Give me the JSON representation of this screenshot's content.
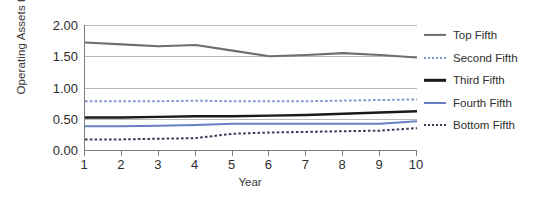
{
  "chart_data": {
    "type": "line",
    "title": "",
    "xlabel": "Year",
    "ylabel": "Operating Assets to Sales",
    "x": [
      1,
      2,
      3,
      4,
      5,
      6,
      7,
      8,
      9,
      10
    ],
    "xtick_labels": [
      "1",
      "2",
      "3",
      "4",
      "5",
      "6",
      "7",
      "8",
      "9",
      "10"
    ],
    "ytick_labels": [
      "0.00",
      "0.50",
      "1.00",
      "1.50",
      "2.00"
    ],
    "ytick_values": [
      0.0,
      0.5,
      1.0,
      1.5,
      2.0
    ],
    "xlim": [
      1,
      10
    ],
    "ylim": [
      0.0,
      2.0
    ],
    "grid": "horizontal",
    "legend_position": "right",
    "series": [
      {
        "name": "Top Fifth",
        "color": "#6e6e6e",
        "style": "solid",
        "width": 2.2,
        "values": [
          1.72,
          1.69,
          1.66,
          1.68,
          1.59,
          1.5,
          1.52,
          1.55,
          1.52,
          1.48
        ]
      },
      {
        "name": "Second Fifth",
        "color": "#8496cf",
        "style": "dotted",
        "width": 2.0,
        "values": [
          0.78,
          0.78,
          0.78,
          0.79,
          0.78,
          0.78,
          0.78,
          0.79,
          0.8,
          0.81
        ]
      },
      {
        "name": "Third Fifth",
        "color": "#1a1a1a",
        "style": "solid",
        "width": 2.4,
        "values": [
          0.52,
          0.52,
          0.53,
          0.54,
          0.54,
          0.55,
          0.56,
          0.58,
          0.6,
          0.62
        ]
      },
      {
        "name": "Fourth Fifth",
        "color": "#6b7fc4",
        "style": "solid",
        "width": 2.0,
        "values": [
          0.38,
          0.38,
          0.39,
          0.4,
          0.42,
          0.42,
          0.42,
          0.42,
          0.42,
          0.46
        ]
      },
      {
        "name": "Bottom Fifth",
        "color": "#3c3c5a",
        "style": "dotted",
        "width": 2.0,
        "values": [
          0.17,
          0.17,
          0.18,
          0.19,
          0.26,
          0.28,
          0.29,
          0.3,
          0.31,
          0.35
        ]
      }
    ]
  },
  "legend": {
    "items": [
      {
        "label": "Top Fifth"
      },
      {
        "label": "Second Fifth"
      },
      {
        "label": "Third Fifth"
      },
      {
        "label": "Fourth Fifth"
      },
      {
        "label": "Bottom Fifth"
      }
    ]
  }
}
